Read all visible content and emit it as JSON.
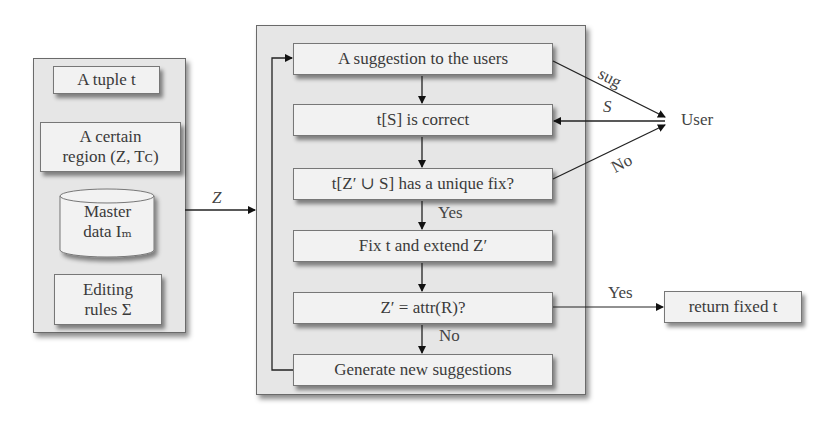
{
  "input_panel": {
    "tuple_box": "A tuple  t",
    "region_box_line1": "A certain",
    "region_box_line2": "region (Z, Tᴄ)",
    "master_data_line1": "Master",
    "master_data_line2": "data  Iₘ",
    "editing_rules_line1": "Editing",
    "editing_rules_line2": "rules Σ"
  },
  "input_arrow_label": "Z",
  "process_panel": {
    "steps": [
      {
        "label": "A suggestion to the users"
      },
      {
        "label": "t[S] is correct"
      },
      {
        "label": "t[Z′ ∪ S] has a unique fix?"
      },
      {
        "label": "Fix t and extend  Z′"
      },
      {
        "label": "Z′ =  attr(R)?"
      },
      {
        "label": "Generate new suggestions"
      }
    ],
    "yes_label_1": "Yes",
    "no_label_1": "No"
  },
  "user": {
    "label": "User",
    "edge_sug": "sug",
    "edge_s": "S",
    "edge_no": "No"
  },
  "output": {
    "yes_label": "Yes",
    "return_box": "return fixed  t"
  }
}
